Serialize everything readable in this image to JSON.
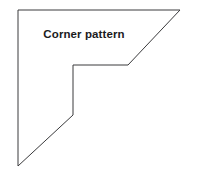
{
  "figure": {
    "label": "Corner pattern",
    "background_color": "#ffffff",
    "stroke_color": "#3a3a3c",
    "stroke_width": 1,
    "fill_color": "#ffffff",
    "label_color": "#1b1b1d",
    "width": 197,
    "height": 185
  },
  "chart_data": {
    "type": "diagram",
    "title": "Corner pattern",
    "shape": "closed polygon, L-shaped quilting corner template",
    "points": [
      [
        18,
        10
      ],
      [
        180,
        10
      ],
      [
        128,
        65
      ],
      [
        73,
        65
      ],
      [
        73,
        115
      ],
      [
        18,
        166
      ]
    ],
    "path": "M 18 10 L 180 10 L 128 65 L 73 65 L 73 115 L 18 166 Z",
    "segments": [
      {
        "from": [
          18,
          10
        ],
        "to": [
          180,
          10
        ],
        "kind": "horizontal-top-edge"
      },
      {
        "from": [
          180,
          10
        ],
        "to": [
          128,
          65
        ],
        "kind": "diagonal-upper-right"
      },
      {
        "from": [
          128,
          65
        ],
        "to": [
          73,
          65
        ],
        "kind": "horizontal-notch-step"
      },
      {
        "from": [
          73,
          65
        ],
        "to": [
          73,
          115
        ],
        "kind": "vertical-notch-step"
      },
      {
        "from": [
          73,
          115
        ],
        "to": [
          18,
          166
        ],
        "kind": "diagonal-lower-left"
      },
      {
        "from": [
          18,
          166
        ],
        "to": [
          18,
          10
        ],
        "kind": "vertical-left-edge"
      }
    ],
    "grid": false,
    "legend": null,
    "xlabel": "",
    "ylabel": ""
  }
}
